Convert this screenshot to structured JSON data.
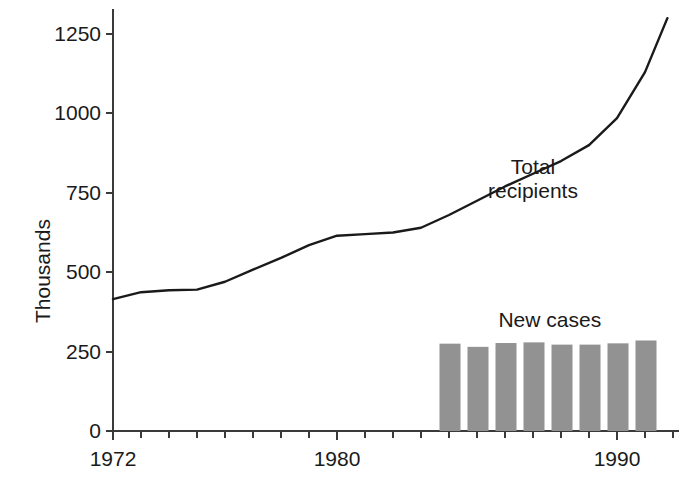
{
  "chart_data": {
    "type": "line",
    "title": "",
    "subtitle": "",
    "xlabel": "",
    "ylabel": "Thousands",
    "xlim": [
      1972,
      1992
    ],
    "ylim": [
      0,
      1330
    ],
    "grid": false,
    "legend_position": "inline-annotations",
    "y_ticks": [
      0,
      250,
      500,
      750,
      1000,
      1250
    ],
    "y_tick_labels": [
      "0",
      "250",
      "500",
      "750",
      "1000",
      "1250"
    ],
    "x_ticks": [
      1972,
      1973,
      1974,
      1975,
      1976,
      1977,
      1978,
      1979,
      1980,
      1981,
      1982,
      1983,
      1984,
      1985,
      1986,
      1987,
      1988,
      1989,
      1990,
      1991,
      1992
    ],
    "x_tick_labels_shown": [
      {
        "year": 1972,
        "label": "1972"
      },
      {
        "year": 1980,
        "label": "1980"
      },
      {
        "year": 1990,
        "label": "1990"
      }
    ],
    "annotations": [
      {
        "text_line1": "Total",
        "text_line2": "recipients",
        "x": 1987.0,
        "y": 830
      },
      {
        "text_line1": "New cases",
        "text_line2": "",
        "x": 1987.6,
        "y": 350
      }
    ],
    "series": [
      {
        "name": "Total recipients",
        "type": "line",
        "color": "#1a1a1a",
        "x": [
          1972,
          1973,
          1974,
          1975,
          1976,
          1977,
          1978,
          1979,
          1980,
          1981,
          1982,
          1983,
          1984,
          1985,
          1986,
          1987,
          1988,
          1989,
          1990,
          1991,
          1991.8
        ],
        "values": [
          415,
          437,
          443,
          445,
          470,
          508,
          545,
          585,
          615,
          620,
          625,
          640,
          680,
          725,
          770,
          810,
          850,
          900,
          985,
          1130,
          1300
        ]
      },
      {
        "name": "New cases",
        "type": "bar",
        "color": "#929292",
        "x": [
          1984,
          1985,
          1986,
          1987,
          1988,
          1989,
          1990,
          1991
        ],
        "values": [
          275,
          265,
          277,
          279,
          272,
          272,
          276,
          285
        ]
      }
    ]
  },
  "axis": {
    "y_title": "Thousands",
    "ticks_y": [
      "1250",
      "1000",
      "750",
      "500",
      "250",
      "0"
    ],
    "ticks_x": [
      "1972",
      "1980",
      "1990"
    ]
  },
  "labels": {
    "total_recipients_line1": "Total",
    "total_recipients_line2": "recipients",
    "new_cases": "New cases"
  },
  "colors": {
    "axis": "#3a3a3a",
    "line": "#1a1a1a",
    "bar": "#929292",
    "text": "#1a1a1a",
    "background": "#ffffff"
  }
}
